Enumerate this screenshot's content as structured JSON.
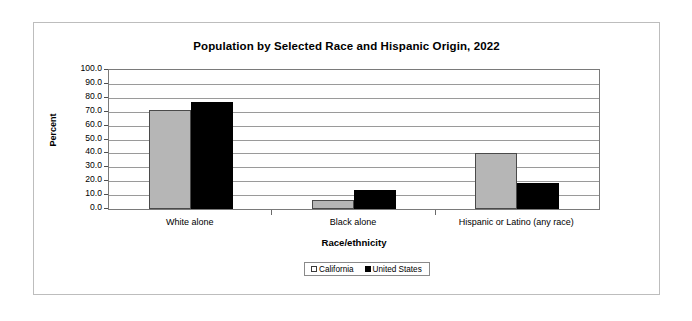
{
  "chart_data": {
    "type": "bar",
    "title": "Population by Selected Race and Hispanic Origin, 2022",
    "xlabel": "Race/ethnicity",
    "ylabel": "Percent",
    "ylim": [
      0,
      100
    ],
    "ytick_step": 10,
    "grid": true,
    "legend_position": "bottom-center",
    "categories": [
      "White alone",
      "Black alone",
      "Hispanic or Latino (any race)"
    ],
    "ytick_labels": [
      "100.0",
      "90.0",
      "80.0",
      "70.0",
      "60.0",
      "50.0",
      "40.0",
      "30.0",
      "20.0",
      "10.0",
      "0.0"
    ],
    "series": [
      {
        "name": "California",
        "color": "#b6b6b6",
        "values": [
          71.0,
          6.5,
          40.0
        ]
      },
      {
        "name": "United States",
        "color": "#000000",
        "values": [
          77.0,
          14.0,
          19.0
        ]
      }
    ]
  },
  "legend": {
    "items": [
      {
        "label": "California"
      },
      {
        "label": "United States"
      }
    ]
  }
}
